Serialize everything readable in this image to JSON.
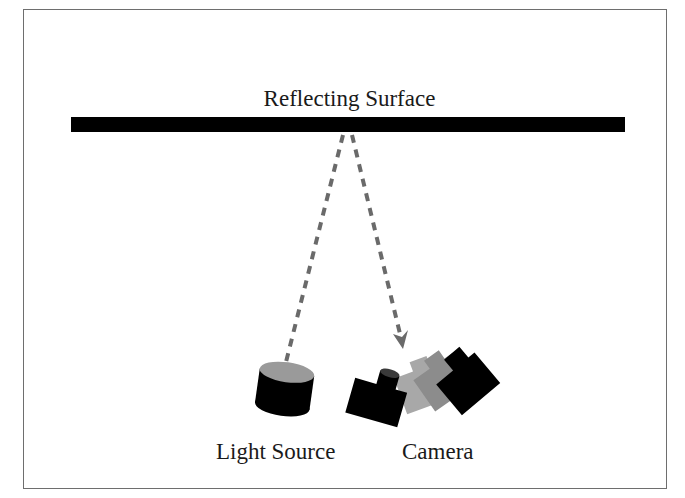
{
  "diagram": {
    "labels": {
      "surface": "Reflecting Surface",
      "light_source": "Light Source",
      "camera": "Camera"
    },
    "colors": {
      "frame": "#6e6e6e",
      "surface": "#000000",
      "ray": "#6a6a6a",
      "object_dark": "#000000",
      "object_light_gray": "#a8a8a8",
      "object_mid_gray": "#8c8c8c",
      "cylinder_top": "#9a9a9a"
    },
    "elements": [
      {
        "name": "reflecting-surface",
        "type": "bar"
      },
      {
        "name": "incident-ray",
        "type": "dashed-line",
        "from": "light-source",
        "to": "reflecting-surface"
      },
      {
        "name": "reflected-ray",
        "type": "dashed-arrow",
        "from": "reflecting-surface",
        "to": "camera"
      },
      {
        "name": "light-source",
        "type": "cylinder"
      },
      {
        "name": "camera",
        "type": "camera-shape",
        "poses": 4
      }
    ]
  }
}
